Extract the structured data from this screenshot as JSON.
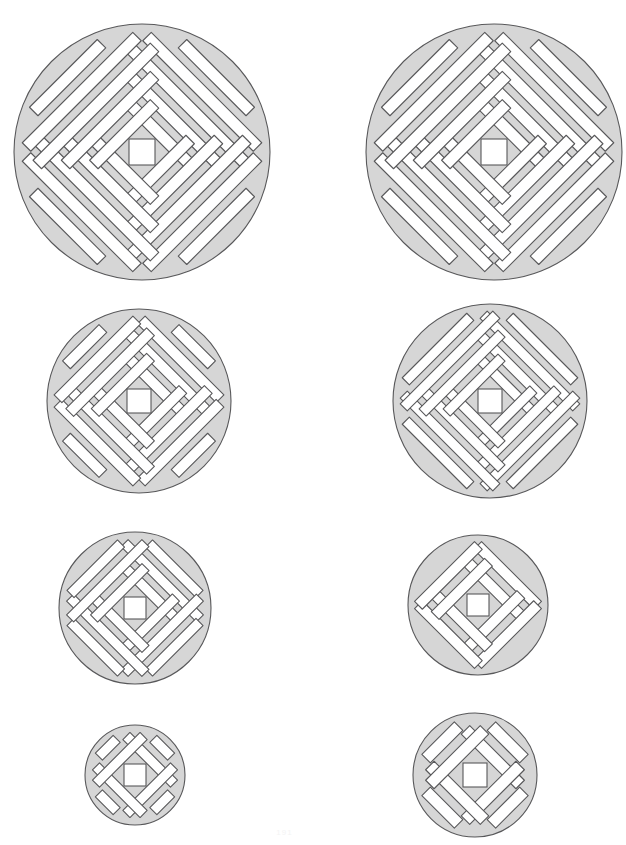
{
  "page": {
    "background_color": "#ffffff",
    "width": 569,
    "height": 845,
    "footnote": "191"
  },
  "style": {
    "fill_color": "#d6d6d6",
    "stroke_color": "#58585a",
    "slot_color": "#ffffff",
    "stroke_width": 1.1
  },
  "figures": [
    {
      "id": "grate-r1c1",
      "name": "grate-large-left",
      "label": "Row 1 Left",
      "cx": 142,
      "cy": 152,
      "r": 128,
      "rim": 6,
      "hub_half": 13,
      "arm_half": 11,
      "slots_per_quadrant": 7,
      "slot_width": 12,
      "slot_gap": 8,
      "clipped": false
    },
    {
      "id": "grate-r1c2",
      "name": "grate-large-right",
      "label": "Row 1 Right",
      "cx": 494,
      "cy": 152,
      "r": 128,
      "rim": 6,
      "hub_half": 13,
      "arm_half": 11,
      "slots_per_quadrant": 7,
      "slot_width": 12,
      "slot_gap": 8,
      "clipped": true
    },
    {
      "id": "grate-r2c1",
      "name": "grate-medium-left",
      "label": "Row 2 Left",
      "cx": 139,
      "cy": 401,
      "r": 92,
      "rim": 5,
      "hub_half": 12,
      "arm_half": 10,
      "slots_per_quadrant": 5,
      "slot_width": 11,
      "slot_gap": 7,
      "clipped": false
    },
    {
      "id": "grate-r2c2",
      "name": "grate-medium-right",
      "label": "Row 2 Right",
      "cx": 490,
      "cy": 401,
      "r": 97,
      "rim": 5,
      "hub_half": 12,
      "arm_half": 10,
      "slots_per_quadrant": 6,
      "slot_width": 10,
      "slot_gap": 7,
      "clipped": true
    },
    {
      "id": "grate-r3c1",
      "name": "grate-small-left",
      "label": "Row 3 Left",
      "cx": 135,
      "cy": 608,
      "r": 76,
      "rim": 4.5,
      "hub_half": 11,
      "arm_half": 9,
      "slots_per_quadrant": 4,
      "slot_width": 10,
      "slot_gap": 7,
      "clipped": false
    },
    {
      "id": "grate-r3c2",
      "name": "grate-small-right",
      "label": "Row 3 Right",
      "cx": 478,
      "cy": 605,
      "r": 70,
      "rim": 4.5,
      "hub_half": 11,
      "arm_half": 9,
      "slots_per_quadrant": 3,
      "slot_width": 11,
      "slot_gap": 8,
      "clipped": false
    },
    {
      "id": "grate-r4c1",
      "name": "grate-mini-left",
      "label": "Row 4 Left",
      "cx": 135,
      "cy": 775,
      "r": 50,
      "rim": 4,
      "hub_half": 11,
      "arm_half": 8,
      "slots_per_quadrant": 2,
      "slot_width": 10,
      "slot_gap": 7,
      "clipped": false
    },
    {
      "id": "grate-r4c2",
      "name": "grate-mini-right",
      "label": "Row 4 Right",
      "cx": 475,
      "cy": 775,
      "r": 62,
      "rim": 4,
      "hub_half": 12,
      "arm_half": 8,
      "slots_per_quadrant": 2,
      "slot_width": 12,
      "slot_gap": 9,
      "clipped": false
    }
  ]
}
